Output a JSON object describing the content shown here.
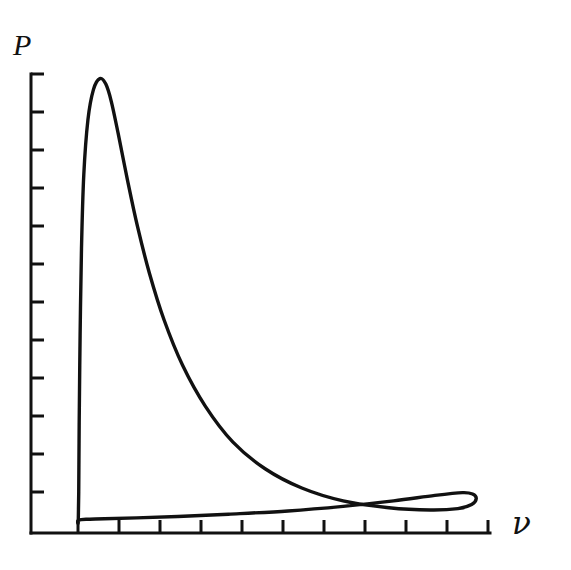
{
  "figure": {
    "title": "",
    "background_color": "#ffffff",
    "ink_color": "#111111",
    "axis_label_y": "P",
    "axis_label_x": "ν",
    "axis_label_x_semantic": "V"
  },
  "chart_data": {
    "type": "line",
    "title": "",
    "subtitle": "",
    "xlabel": "V",
    "ylabel": "P",
    "legend": [],
    "legend_position": "none",
    "grid": false,
    "annotations": [],
    "axes": {
      "x_axis": {
        "label": "V",
        "origin_px": 31,
        "end_px": 490,
        "baseline_y_px": 533,
        "tick_count": 11,
        "tick_direction": "up",
        "tick_length_px": 13,
        "tick_positions_px": [
          78,
          119,
          160,
          201,
          242,
          283,
          324,
          365,
          406,
          447,
          488
        ],
        "tick_labels": [],
        "range": [
          0,
          1
        ]
      },
      "y_axis": {
        "label": "P",
        "origin_px": 533,
        "end_px": 74,
        "baseline_x_px": 31,
        "tick_count": 12,
        "tick_direction": "right",
        "tick_length_px": 13,
        "tick_positions_px": [
          74,
          112,
          150,
          188,
          226,
          264,
          302,
          340,
          378,
          416,
          454,
          492
        ],
        "tick_labels": [],
        "range": [
          0,
          1
        ]
      }
    },
    "series": [
      {
        "name": "pv-loop",
        "closed": true,
        "description": "Closed pressure-volume loop: steep rise to a sharp peak near the left, long convex decay to the right, a rounded right-hand turning point, then a thin flat return path along the baseline back to the left.",
        "points": [
          [
            0.103,
            0.025
          ],
          [
            0.104,
            0.09
          ],
          [
            0.105,
            0.24
          ],
          [
            0.107,
            0.43
          ],
          [
            0.11,
            0.62
          ],
          [
            0.115,
            0.78
          ],
          [
            0.124,
            0.9
          ],
          [
            0.136,
            0.966
          ],
          [
            0.15,
            0.99
          ],
          [
            0.163,
            0.978
          ],
          [
            0.175,
            0.94
          ],
          [
            0.19,
            0.87
          ],
          [
            0.21,
            0.77
          ],
          [
            0.232,
            0.668
          ],
          [
            0.258,
            0.566
          ],
          [
            0.29,
            0.464
          ],
          [
            0.33,
            0.366
          ],
          [
            0.38,
            0.276
          ],
          [
            0.44,
            0.198
          ],
          [
            0.51,
            0.14
          ],
          [
            0.59,
            0.098
          ],
          [
            0.68,
            0.07
          ],
          [
            0.78,
            0.055
          ],
          [
            0.87,
            0.05
          ],
          [
            0.93,
            0.053
          ],
          [
            0.96,
            0.062
          ],
          [
            0.97,
            0.075
          ],
          [
            0.962,
            0.085
          ],
          [
            0.94,
            0.088
          ],
          [
            0.88,
            0.082
          ],
          [
            0.79,
            0.07
          ],
          [
            0.68,
            0.058
          ],
          [
            0.56,
            0.048
          ],
          [
            0.43,
            0.041
          ],
          [
            0.32,
            0.036
          ],
          [
            0.23,
            0.033
          ],
          [
            0.16,
            0.031
          ],
          [
            0.12,
            0.03
          ],
          [
            0.103,
            0.028
          ]
        ]
      }
    ]
  }
}
